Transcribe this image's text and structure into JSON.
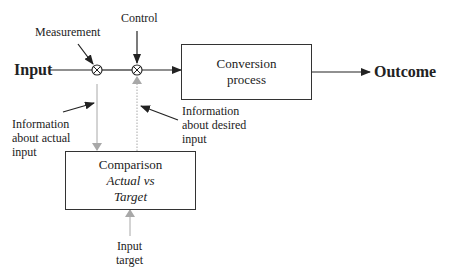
{
  "diagram": {
    "input_label": "Input",
    "outcome_label": "Outcome",
    "measurement_label": "Measurement",
    "control_label": "Control",
    "process_box": {
      "line1": "Conversion",
      "line2": "process"
    },
    "comparison_box": {
      "title": "Comparison",
      "line2": "Actual vs",
      "line3": "Target"
    },
    "info_actual": {
      "line1": "Information",
      "line2": "about actual",
      "line3": "input"
    },
    "info_desired": {
      "line1": "Information",
      "line2": "about desired",
      "line3": "input"
    },
    "input_target": {
      "line1": "Input",
      "line2": "target"
    },
    "colors": {
      "line": "#222222",
      "feedback": "#a8a8a8"
    }
  }
}
